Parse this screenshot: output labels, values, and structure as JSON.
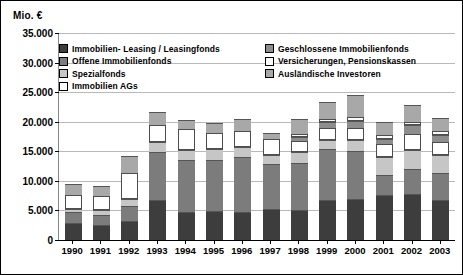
{
  "chart_data": {
    "type": "bar",
    "subtype": "stacked-column",
    "title": "",
    "ylabel": "Mio. €",
    "xlabel": "",
    "ylim": [
      0,
      35000
    ],
    "ytick_step": 5000,
    "ytick_labels": [
      "35.000",
      "30.000",
      "25.000",
      "20.000",
      "15.000",
      "10.000",
      "5.000",
      "0"
    ],
    "ytick_values": [
      35000,
      30000,
      25000,
      20000,
      15000,
      10000,
      5000,
      0
    ],
    "grid": true,
    "legend_position": "inside-top",
    "categories": [
      "1990",
      "1991",
      "1992",
      "1993",
      "1994",
      "1995",
      "1996",
      "1997",
      "1998",
      "1999",
      "2000",
      "2001",
      "2002",
      "2003"
    ],
    "series": [
      {
        "name": "Immobilien- Leasing / Leasingfonds",
        "color": "#3d3d3d",
        "values": [
          2900,
          2500,
          3200,
          6700,
          4800,
          4900,
          4800,
          5300,
          5100,
          6800,
          6900,
          7600,
          7800,
          6800
        ]
      },
      {
        "name": "Offene Immobilienfonds",
        "color": "#7c7c7c",
        "values": [
          1900,
          1800,
          2600,
          8200,
          8800,
          8600,
          9200,
          7600,
          7900,
          8600,
          8100,
          3400,
          4200,
          4600
        ]
      },
      {
        "name": "Spezialfonds",
        "color": "#c6c6c6",
        "values": [
          500,
          700,
          1200,
          1700,
          1700,
          1900,
          1700,
          1500,
          1800,
          1500,
          1900,
          3000,
          3300,
          3000
        ]
      },
      {
        "name": "Immobilien AGs",
        "color": "#ffffff",
        "values": [
          2300,
          2400,
          4300,
          2900,
          3400,
          2700,
          2800,
          2600,
          1900,
          2100,
          2000,
          2200,
          2700,
          2200
        ]
      },
      {
        "name": "Geschlossene Immobilienfonds",
        "color": "#8d8d8d",
        "values": [
          0,
          0,
          0,
          0,
          0,
          0,
          0,
          0,
          700,
          900,
          1200,
          900,
          1400,
          1200
        ]
      },
      {
        "name": "Versicherungen, Pensionskassen",
        "color": "#fafafa",
        "values": [
          0,
          0,
          0,
          0,
          0,
          0,
          0,
          0,
          600,
          600,
          700,
          600,
          600,
          700
        ]
      },
      {
        "name": "Ausländische Investoren",
        "color": "#a8a8a8",
        "values": [
          1900,
          1800,
          2900,
          2100,
          1600,
          1700,
          1900,
          1100,
          2400,
          2800,
          3800,
          2200,
          2900,
          2200
        ]
      }
    ],
    "totals": [
      9500,
      9200,
      14200,
      21600,
      20300,
      19800,
      20400,
      18100,
      20400,
      23300,
      24600,
      19900,
      22900,
      20700
    ]
  },
  "legend": {
    "left_column": [
      "Immobilien- Leasing / Leasingfonds",
      "Offene Immobilienfonds",
      "Spezialfonds",
      "Immobilien AGs"
    ],
    "right_column": [
      "Geschlossene  Immobilienfonds",
      "Versicherungen, Pensionskassen",
      "Ausländische  Investoren"
    ]
  }
}
